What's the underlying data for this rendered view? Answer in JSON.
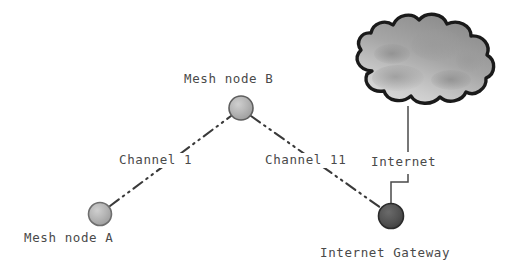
{
  "diagram": {
    "background_color": "#ffffff",
    "text_color": "#4a4a4a",
    "nodes": [
      {
        "id": "mesh-node-a",
        "label": "Mesh node A",
        "shape": "circle",
        "fill": "#b0b0b0",
        "stroke": "#6e6e6e",
        "cx": 100,
        "cy": 214,
        "r": 11.5
      },
      {
        "id": "mesh-node-b",
        "label": "Mesh node B",
        "shape": "circle",
        "fill": "#a8a8a8",
        "stroke": "#5e5e5e",
        "cx": 241,
        "cy": 108,
        "r": 12
      },
      {
        "id": "internet-gateway",
        "label": "Internet Gateway",
        "shape": "circle",
        "fill": "#4f4f4f",
        "stroke": "#2b2b2b",
        "cx": 391,
        "cy": 216,
        "r": 12.5
      }
    ],
    "cloud": {
      "id": "internet-cloud",
      "label": "Internet",
      "fill_light": "#d2d2d2",
      "fill_mid": "#9b9b9b",
      "fill_dark": "#7d7d7d",
      "stroke": "#1a1a1a"
    },
    "links": [
      {
        "id": "link-a-b",
        "label": "Channel 1",
        "style": "dash-dot-dot",
        "color": "#3a3a3a",
        "from": "mesh-node-a",
        "to": "mesh-node-b"
      },
      {
        "id": "link-b-gateway",
        "label": "Channel 11",
        "style": "dash-dot-dot",
        "color": "#3a3a3a",
        "from": "mesh-node-b",
        "to": "internet-gateway"
      },
      {
        "id": "link-gateway-internet",
        "label": "Internet",
        "style": "solid-stepped",
        "color": "#4a4a4a",
        "from": "internet-gateway",
        "to": "internet-cloud"
      }
    ],
    "labels": {
      "mesh_node_a": "Mesh node A",
      "mesh_node_b": "Mesh node B",
      "channel_1": "Channel 1",
      "channel_11": "Channel 11",
      "internet": "Internet",
      "internet_gateway": "Internet Gateway"
    }
  }
}
